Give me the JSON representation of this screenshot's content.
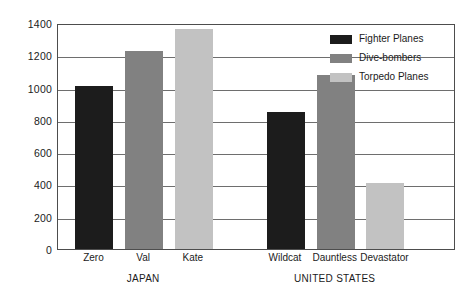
{
  "chart_data": {
    "type": "bar",
    "title": "",
    "subtitle": "",
    "xlabel": "",
    "ylabel": "",
    "ylim": [
      0,
      1400
    ],
    "grid": true,
    "legend_position": "top-right",
    "categories": [
      "Zero",
      "Val",
      "Kate",
      "Wildcat",
      "Dauntless",
      "Devastator"
    ],
    "groups": [
      {
        "name": "JAPAN",
        "categories": [
          "Zero",
          "Val",
          "Kate"
        ]
      },
      {
        "name": "UNITED STATES",
        "categories": [
          "Wildcat",
          "Dauntless",
          "Devastator"
        ]
      }
    ],
    "series": [
      {
        "name": "Fighter Planes",
        "color": "#1c1c1c"
      },
      {
        "name": "Dive-bombers",
        "color": "#818181"
      },
      {
        "name": "Torpedo Planes",
        "color": "#c2c2c2"
      }
    ],
    "bars": [
      {
        "category": "Zero",
        "group": "JAPAN",
        "series": "Fighter Planes",
        "value": 1010,
        "color": "#1c1c1c"
      },
      {
        "category": "Val",
        "group": "JAPAN",
        "series": "Dive-bombers",
        "value": 1225,
        "color": "#818181"
      },
      {
        "category": "Kate",
        "group": "JAPAN",
        "series": "Torpedo Planes",
        "value": 1365,
        "color": "#c2c2c2"
      },
      {
        "category": "Wildcat",
        "group": "UNITED STATES",
        "series": "Fighter Planes",
        "value": 850,
        "color": "#1c1c1c"
      },
      {
        "category": "Dauntless",
        "group": "UNITED STATES",
        "series": "Dive-bombers",
        "value": 1075,
        "color": "#818181"
      },
      {
        "category": "Devastator",
        "group": "UNITED STATES",
        "series": "Torpedo Planes",
        "value": 410,
        "color": "#c2c2c2"
      }
    ],
    "yticks": [
      0,
      200,
      400,
      600,
      800,
      1000,
      1200,
      1400
    ],
    "ytick_labels": [
      "0",
      "200",
      "400",
      "600",
      "800",
      "1000",
      "1200",
      "1400"
    ]
  },
  "legend": {
    "items": [
      {
        "label": "Fighter Planes",
        "swatch": "fighter"
      },
      {
        "label": "Dive-bombers",
        "swatch": "dive"
      },
      {
        "label": "Torpedo Planes",
        "swatch": "torpedo"
      }
    ]
  },
  "colors": {
    "fighter_planes": "#1c1c1c",
    "dive_bombers": "#818181",
    "torpedo_planes": "#c2c2c2",
    "gridline": "#6e6e6e",
    "frame": "#4d4d4d",
    "text": "#1b1b1b",
    "background": "#ffffff"
  }
}
